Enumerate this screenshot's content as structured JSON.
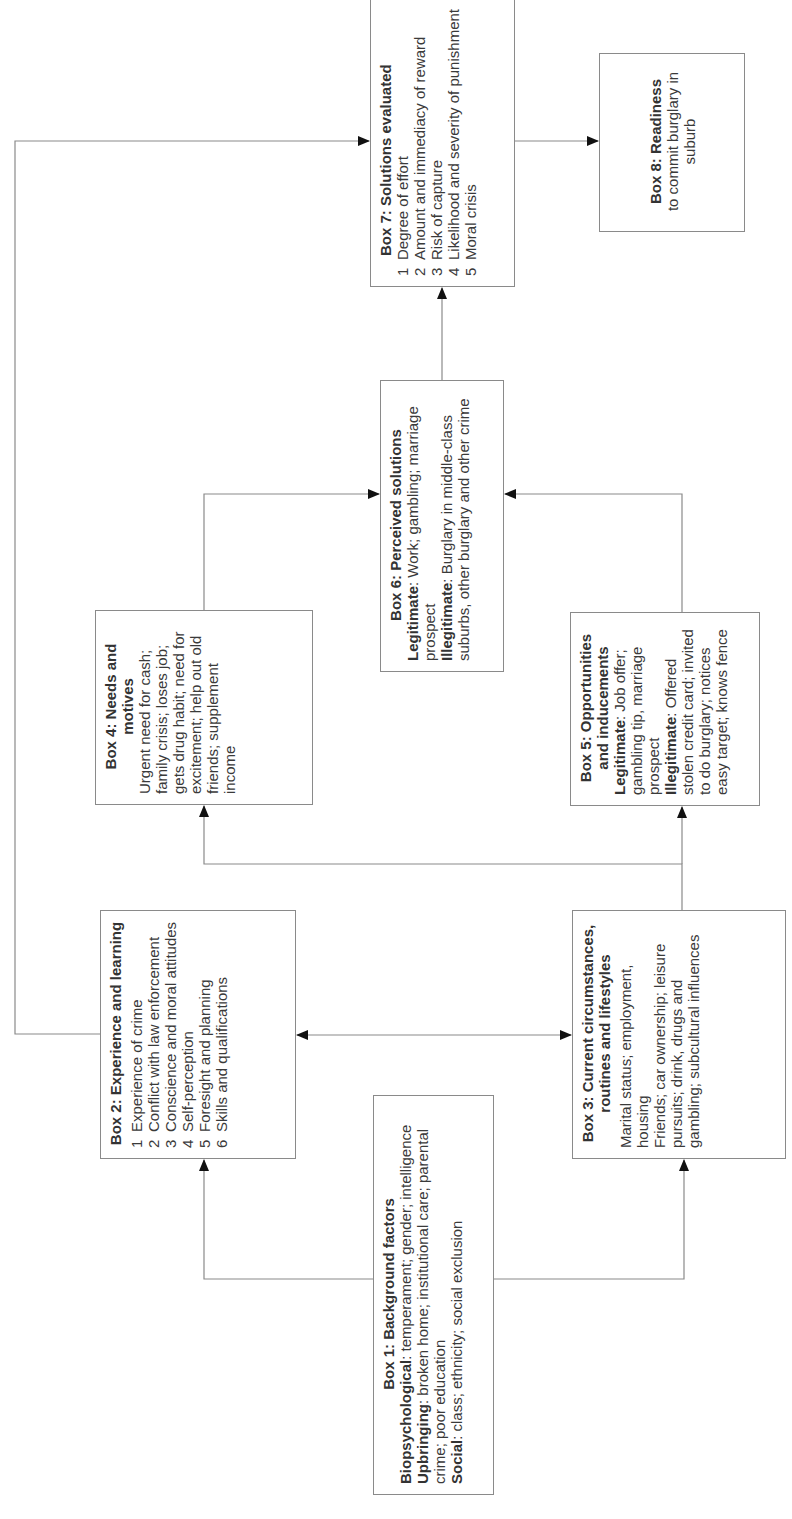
{
  "diagram": {
    "orientation": "rotated 90 degrees counter-clockwise",
    "boxes": {
      "box1": {
        "title": "Box 1: Background factors",
        "items": [
          {
            "label": "Biopsychological",
            "text": ": temperament; gender; intelligence"
          },
          {
            "label": "Upbringing",
            "text": ": broken home; institutional care; parental crime; poor education"
          },
          {
            "label": "Social",
            "text": ": class; ethnicity; social exclusion"
          }
        ]
      },
      "box2": {
        "title": "Box 2: Experience and learning",
        "items": [
          {
            "num": "1",
            "text": "Experience of crime"
          },
          {
            "num": "2",
            "text": "Conflict with law enforcement"
          },
          {
            "num": "3",
            "text": "Conscience and moral attitudes"
          },
          {
            "num": "4",
            "text": "Self-perception"
          },
          {
            "num": "5",
            "text": "Foresight and planning"
          },
          {
            "num": "6",
            "text": "Skills and qualifications"
          }
        ]
      },
      "box3": {
        "title": "Box 3: Current circumstances, routines and lifestyles",
        "lines": [
          "Marital status; employment, housing",
          "Friends; car ownership; leisure pursuits; drink, drugs and gambling; subcultural influences"
        ]
      },
      "box4": {
        "title": "Box 4: Needs and motives",
        "text": "Urgent need for cash; family crisis; loses job; gets drug habit; need for excitement; help out old friends; supplement income"
      },
      "box5": {
        "title": "Box 5: Opportunities and inducements",
        "items": [
          {
            "label": "Legitimate",
            "text": ": Job offer; gambling tip, marriage prospect"
          },
          {
            "label": "Illegitimate",
            "text": ": Offered stolen credit card; invited to do burglary; notices easy target; knows fence"
          }
        ]
      },
      "box6": {
        "title": "Box 6: Perceived solutions",
        "items": [
          {
            "label": "Legitimate",
            "text": ": Work; gambling; marriage prospect"
          },
          {
            "label": "Illegitimate",
            "text": ": Burglary in middle-class suburbs, other burglary and other crime"
          }
        ]
      },
      "box7": {
        "title": "Box 7: Solutions evaluated",
        "items": [
          {
            "num": "1",
            "text": "Degree of effort"
          },
          {
            "num": "2",
            "text": "Amount and immediacy of reward"
          },
          {
            "num": "3",
            "text": "Risk of capture"
          },
          {
            "num": "4",
            "text": "Likelihood and severity of punishment"
          },
          {
            "num": "5",
            "text": "Moral crisis"
          }
        ]
      },
      "box8": {
        "title": "Box 8: Readiness",
        "text": "to commit burglary in suburb"
      }
    },
    "connections": [
      {
        "from": "box1",
        "to": "box2"
      },
      {
        "from": "box1",
        "to": "box3"
      },
      {
        "from": "box2",
        "to": "box3",
        "bidirectional": true
      },
      {
        "from": "box2",
        "to": "box7"
      },
      {
        "from": "box3",
        "to": "box4"
      },
      {
        "from": "box3",
        "to": "box5"
      },
      {
        "from": "box4",
        "to": "box6"
      },
      {
        "from": "box5",
        "to": "box6"
      },
      {
        "from": "box6",
        "to": "box7"
      },
      {
        "from": "box7",
        "to": "box8"
      }
    ],
    "colors": {
      "line": "#8a8a8a",
      "arrow": "#111111",
      "text": "#333333"
    }
  }
}
